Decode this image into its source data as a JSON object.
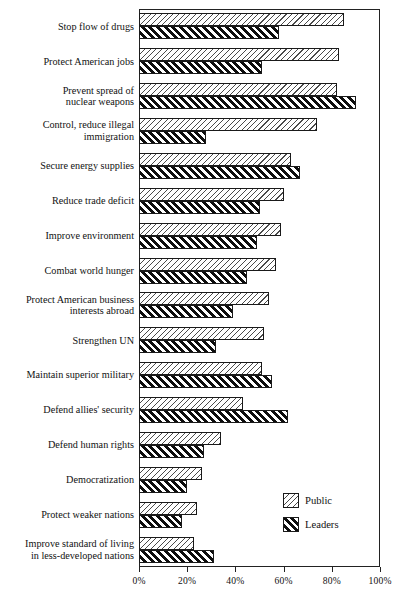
{
  "chart_data": {
    "type": "bar",
    "orientation": "horizontal",
    "title": "",
    "xlabel": "",
    "ylabel": "",
    "xlim": [
      0,
      100
    ],
    "xticks": [
      0,
      20,
      40,
      60,
      80,
      100
    ],
    "xtick_labels": [
      "0%",
      "20%",
      "40%",
      "60%",
      "80%",
      "100%"
    ],
    "grid": false,
    "legend_position": "inside-lower-right",
    "categories": [
      "Stop flow  of drugs",
      "Protect American jobs",
      "Prevent spread of\nnuclear weapons",
      "Control, reduce illegal\nimmigration",
      "Secure energy supplies",
      "Reduce trade deficit",
      "Improve environment",
      "Combat world hunger",
      "Protect American business\ninterests abroad",
      "Strengthen UN",
      "Maintain superior military",
      "Defend allies' security",
      "Defend human rights",
      "Democratization",
      "Protect weaker nations",
      "Improve standard of living\nin less-developed nations"
    ],
    "series": [
      {
        "name": "Public",
        "values": [
          85,
          83,
          82,
          74,
          63,
          60,
          59,
          57,
          54,
          52,
          51,
          43,
          34,
          26,
          24,
          23
        ]
      },
      {
        "name": "Leaders",
        "values": [
          58,
          51,
          90,
          28,
          67,
          50,
          49,
          45,
          39,
          32,
          55,
          62,
          27,
          20,
          18,
          31
        ]
      }
    ]
  },
  "legend": {
    "items": [
      {
        "label": "Public",
        "pattern": "light-hatch"
      },
      {
        "label": "Leaders",
        "pattern": "bold-hatch"
      }
    ]
  },
  "colors": {
    "axis": "#222222",
    "bar_outline": "#1a1a1a",
    "public_hatch": "#4a4a4a",
    "leaders_hatch": "#0d0d0d",
    "background": "#ffffff",
    "text": "#111111"
  }
}
